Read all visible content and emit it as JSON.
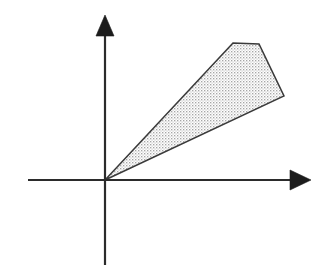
{
  "figure": {
    "kind": "math-diagram",
    "background_color": "#ffffff",
    "width": 328,
    "height": 273
  },
  "chart_data": {
    "type": "scatter",
    "title": "",
    "subtitle": "",
    "xlabel": "",
    "ylabel": "",
    "xlim": [
      -77,
      205
    ],
    "ylim": [
      -85,
      164
    ],
    "grid": false,
    "legend": null,
    "tick_labels": {
      "x": [],
      "y": []
    },
    "annotations": [],
    "axes": {
      "origin": {
        "x": 105,
        "y": 180
      },
      "x_axis": {
        "name": "x-axis",
        "start": {
          "x": 28,
          "y": 180
        },
        "end": {
          "x": 292,
          "y": 180
        },
        "arrow_tip": {
          "x": 311,
          "y": 180
        },
        "arrow_half_height": 10,
        "color": "#2b2b2b"
      },
      "y_axis": {
        "name": "y-axis",
        "start": {
          "x": 105,
          "y": 265
        },
        "end": {
          "x": 105,
          "y": 34
        },
        "arrow_tip": {
          "x": 105,
          "y": 15
        },
        "arrow_half_width": 9,
        "color": "#2b2b2b"
      }
    },
    "shaded_region": {
      "name": "cone",
      "label": "",
      "fill_style": "stipple-crosshatch",
      "fill_color": "#9a9a9a",
      "fill_background": "#ffffff",
      "edge_color": "#3a3a3a",
      "edge_width": 1.5,
      "apex": {
        "x": 105,
        "y": 180
      },
      "upper_ray": {
        "name": "upper-boundary-ray",
        "from": {
          "x": 105,
          "y": 180
        },
        "to": {
          "x": 233,
          "y": 43
        },
        "slope": 1.07
      },
      "lower_ray": {
        "name": "lower-boundary-ray",
        "from": {
          "x": 105,
          "y": 180
        },
        "to": {
          "x": 284,
          "y": 96
        },
        "slope": 0.47
      },
      "closing_edge": {
        "name": "truncation-edge",
        "points": [
          {
            "x": 233,
            "y": 43
          },
          {
            "x": 259,
            "y": 44
          },
          {
            "x": 284,
            "y": 96
          }
        ]
      },
      "polygon": [
        {
          "x": 105,
          "y": 180
        },
        {
          "x": 233,
          "y": 43
        },
        {
          "x": 259,
          "y": 44
        },
        {
          "x": 284,
          "y": 96
        }
      ]
    }
  }
}
